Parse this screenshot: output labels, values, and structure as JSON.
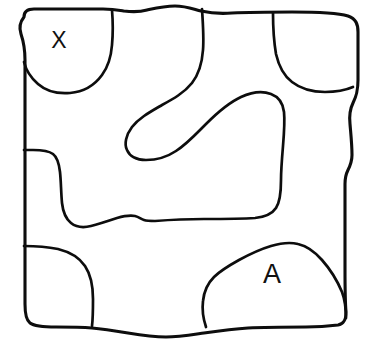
{
  "diagram": {
    "background_color": "#ffffff",
    "stroke_color": "#0d0d0d",
    "stroke_width": 3.1,
    "width": 379,
    "height": 348,
    "labels": [
      {
        "id": "label-x",
        "text": "X",
        "x": 59,
        "y": 42,
        "font_size": 23
      },
      {
        "id": "label-a",
        "text": "A",
        "x": 272,
        "y": 276,
        "font_size": 27
      }
    ],
    "regions": [
      {
        "name": "top-left-lobe",
        "label": "X"
      },
      {
        "name": "top-right-lobe",
        "label": ""
      },
      {
        "name": "central-hook-region",
        "label": ""
      },
      {
        "name": "left-middle-region",
        "label": ""
      },
      {
        "name": "bottom-left-lobe",
        "label": ""
      },
      {
        "name": "bottom-right-blob",
        "label": "A"
      },
      {
        "name": "background-region",
        "label": ""
      }
    ],
    "paths": {
      "outer_border": "M 24 17 C 24 11 28 9 34 9 L 103 9 C 113 9 118 10 124 11 C 132 12 140 12 147 10 C 156 8 164 6 175 6 C 186 6 193 9 201 11 C 210 13 220 14 232 13 C 252 12 272 12 292 12 C 320 12 338 13 348 16 C 356 19 358 24 358 32 L 358 80 C 358 92 356 97 353 103 C 350 109 349 115 350 124 C 351 136 352 145 352 155 C 352 162 350 166 348 170 C 346 174 345 178 345 184 L 345 268 C 345 284 345 300 346 312 C 346 320 344 324 338 325 C 330 326 318 327 306 327 C 286 327 266 327 248 328 C 232 329 218 331 204 333 C 190 335 178 337 166 337 C 152 337 140 335 128 333 C 116 331 104 329 92 328 C 80 327 68 327 56 327 C 42 327 34 326 30 323 C 26 320 25 314 25 304 L 25 60 C 25 48 23 40 21 34 C 19 28 20 22 24 17 Z",
      "top_left_lobe": "M 112 10 C 113 22 113 34 112 45 C 111 58 108 67 102 75 C 94 86 82 92 70 93 C 58 94 46 91 38 84 C 31 78 26 70 24 62",
      "top_right_lobe": "M 273 13 C 273 28 274 42 276 54 C 279 67 284 76 292 82 C 301 89 313 92 325 92 C 336 92 346 90 353 87",
      "central_hook": "M 202 9 C 203 24 204 38 203 50 C 202 64 199 74 192 83 C 184 93 173 99 162 105 C 150 112 139 118 132 127 C 126 135 124 144 127 150 C 130 157 137 160 146 160 C 156 160 167 157 176 151 C 187 144 196 134 206 124 C 217 113 228 103 241 97 C 252 92 263 91 271 94 C 279 97 283 103 284 112 C 285 122 284 134 283 146 C 282 158 281 170 281 180 C 281 192 280 202 276 208 C 272 214 265 217 255 218 C 240 219 222 219 204 219 C 186 219 168 220 155 221 C 150 221 147 221 144 220 C 141 219 139 217 135 216 C 130 215 124 216 117 218 C 108 221 99 224 91 226 C 83 228 76 227 71 223 C 66 219 63 212 62 203 C 61 192 61 181 60 172 C 59 163 57 157 53 154 C 49 151 42 150 33 150 C 29 150 26 150 24 150",
      "bottom_left_lobe": "M 24 246 C 36 246 48 247 58 249 C 70 252 79 257 85 266 C 91 275 93 287 93 299 C 93 309 93 318 92 326",
      "bottom_right_blob": "M 206 327 C 203 318 202 309 203 301 C 204 291 208 283 214 277 C 221 270 230 265 239 260 C 250 254 261 249 271 246 C 281 243 290 242 298 244 C 307 246 315 252 322 260 C 330 269 337 280 342 292 C 345 300 346 310 346 318"
    }
  }
}
